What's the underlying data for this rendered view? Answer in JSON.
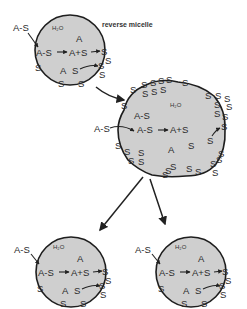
{
  "title_label": "reverse micelle",
  "water_label": "H₂O",
  "species": {
    "surfactant": "S",
    "complex": "A-S",
    "product": "A",
    "reaction": "A-S",
    "reaction_products": "A+S"
  },
  "micelles": [
    {
      "id": "initial",
      "labels": {
        "h2o": "H₂O",
        "incoming": "A-S",
        "complex": "A-S",
        "products": "A+S",
        "free_A1": "A",
        "free_A2": "A",
        "free_S": "S"
      }
    },
    {
      "id": "grown",
      "labels": {
        "h2o": "H₂O",
        "incoming": "A-S",
        "complex_upper": "A-S",
        "complex": "A-S",
        "products": "A+S",
        "free_A": "A",
        "free_S1": "S",
        "free_S2": "S"
      }
    },
    {
      "id": "daughter-left",
      "labels": {
        "h2o": "H₂O",
        "incoming": "A-S",
        "complex": "A-S",
        "products": "A+S",
        "free_A1": "A",
        "free_A2": "A",
        "free_S": "S"
      }
    },
    {
      "id": "daughter-right",
      "labels": {
        "h2o": "H₂O",
        "incoming": "A-S",
        "complex": "A-S",
        "products": "A+S",
        "free_A1": "A",
        "free_A2": "A",
        "free_S": "S"
      }
    }
  ],
  "colors": {
    "micelle_fill": "#cfcfcf",
    "outline": "#1e1e1e",
    "background": "#ffffff"
  }
}
